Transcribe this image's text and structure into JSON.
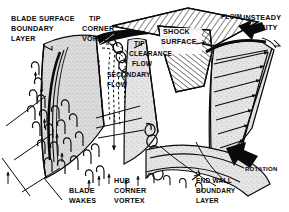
{
  "figure": {
    "style": "black and white line drawing with stipple shading and hatching",
    "background_color": "#ffffff",
    "ink_color": "#0a0a0a",
    "blade_fill_color": "#d9d9d9",
    "endwall_fill_color": "#e6e6e6"
  },
  "labels": {
    "blade_surface_boundary_layer": {
      "line1": "BLADE SURFACE",
      "line2": "BOUNDARY",
      "line3": "LAYER",
      "leader": "hooked leader to suction surface"
    },
    "tip_corner_vortex": {
      "line1": "TIP",
      "line2": "CORNER",
      "line3": "VORTEX"
    },
    "tip_clearance_flow": {
      "line1": "TIP",
      "line2": "CLEARANCE",
      "line3": "FLOW"
    },
    "secondary_flow": {
      "line1": "SECONDARY",
      "line2": "FLOW"
    },
    "shock_surface": {
      "line1": "SHOCK",
      "line2": "SURFACE"
    },
    "flow": {
      "line1": "FLOW",
      "arrow": "thick solid arrow pointing down-left"
    },
    "unsteady_velocity": {
      "line1": "UNSTEADY",
      "line2": "VELOCITY",
      "leader": "hooked leader to velocity profile"
    },
    "rotation": {
      "line1": "ROTATION",
      "arrow": "thick solid arrow pointing down-right"
    },
    "end_wall_boundary_layer": {
      "line1": "END WALL",
      "line2": "BOUNDARY",
      "line3": "LAYER",
      "leader": "hooked leader to hub surface"
    },
    "blade_wakes": {
      "line1": "BLADE",
      "line2": "WAKES"
    },
    "hub_corner_vortex": {
      "line1": "HUB",
      "line2": "CORNER",
      "line3": "VORTEX"
    }
  },
  "features": [
    {
      "name": "casing-hatched-surface",
      "description": "cross-hatched shroud/casing panel across top"
    },
    {
      "name": "blade-suction-surface",
      "description": "large stippled blade surface at left"
    },
    {
      "name": "blade-mid-surface",
      "description": "stippled middle blade"
    },
    {
      "name": "blade-right-surface",
      "description": "stippled right blade with velocity profile"
    },
    {
      "name": "hub-endwall",
      "description": "curved stippled hub endwall at bottom"
    },
    {
      "name": "horseshoe-vortex-loops",
      "description": "rows of hairpin vortex loops on blade surface"
    },
    {
      "name": "tip-vortex-spiral",
      "description": "spiral coil of vortex filaments near tip"
    },
    {
      "name": "hub-vortex-spiral",
      "description": "spiral coil of vortex filaments near hub"
    },
    {
      "name": "velocity-profile-arrows",
      "description": "row of arrows forming unsteady velocity profile"
    },
    {
      "name": "shock-hatched-wedge",
      "description": "hatched wedge representing shock surface"
    },
    {
      "name": "dashed-clearance-streamlines",
      "description": "dashed vertical streamlines for tip clearance flow"
    }
  ]
}
